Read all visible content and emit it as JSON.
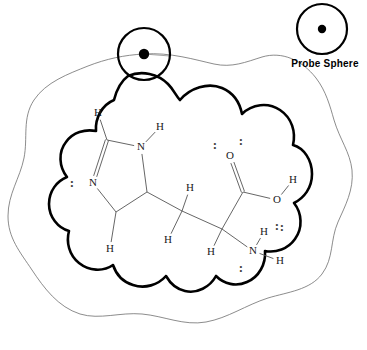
{
  "figure": {
    "legend_label": "Probe Sphere",
    "colors": {
      "molecular_surface": "#000000",
      "solvent_accessible_surface": "#6e6e6e",
      "bond": "#555555",
      "atom_text": "#1a1a1a",
      "background": "#ffffff"
    }
  },
  "probe_sphere": {
    "legend": {
      "label": "Probe Sphere",
      "cx": 322,
      "cy": 29,
      "r": 25,
      "dot_r": 4.2
    },
    "rolling": {
      "cx": 144,
      "cy": 54,
      "r": 26,
      "dot_r": 5.2
    }
  },
  "molecule": {
    "name": "histidine",
    "atoms": [
      {
        "id": "h-ring-c2",
        "label": "H",
        "x": 98,
        "y": 113
      },
      {
        "id": "c2",
        "label": "",
        "x": 107,
        "y": 140
      },
      {
        "id": "n1",
        "label": "N",
        "x": 141,
        "y": 147
      },
      {
        "id": "h-n1",
        "label": "H",
        "x": 160,
        "y": 127
      },
      {
        "id": "n3",
        "label": "N",
        "x": 93,
        "y": 183
      },
      {
        "id": "c4",
        "label": "",
        "x": 116,
        "y": 212
      },
      {
        "id": "h-c4",
        "label": "H",
        "x": 110,
        "y": 249
      },
      {
        "id": "c5",
        "label": "",
        "x": 147,
        "y": 192
      },
      {
        "id": "cb",
        "label": "",
        "x": 182,
        "y": 211
      },
      {
        "id": "h-cb-up",
        "label": "H",
        "x": 190,
        "y": 188
      },
      {
        "id": "h-cb-dn",
        "label": "H",
        "x": 168,
        "y": 240
      },
      {
        "id": "ca",
        "label": "",
        "x": 222,
        "y": 229
      },
      {
        "id": "h-ca",
        "label": "H",
        "x": 211,
        "y": 252
      },
      {
        "id": "c-carboxyl",
        "label": "",
        "x": 243,
        "y": 192
      },
      {
        "id": "o-double",
        "label": "O",
        "x": 230,
        "y": 156
      },
      {
        "id": "o-hydroxyl",
        "label": "O",
        "x": 277,
        "y": 200
      },
      {
        "id": "h-hydroxyl",
        "label": "H",
        "x": 293,
        "y": 180
      },
      {
        "id": "n-amine",
        "label": "N",
        "x": 253,
        "y": 251
      },
      {
        "id": "h-amine-up",
        "label": "H",
        "x": 264,
        "y": 232
      },
      {
        "id": "h-amine-rt",
        "label": "H",
        "x": 280,
        "y": 261
      }
    ],
    "bonds": [
      {
        "from": "h-ring-c2",
        "to": "c2",
        "order": 1
      },
      {
        "from": "c2",
        "to": "n1",
        "order": 1
      },
      {
        "from": "n1",
        "to": "h-n1",
        "order": 1
      },
      {
        "from": "c2",
        "to": "n3",
        "order": 2
      },
      {
        "from": "n3",
        "to": "c4",
        "order": 1
      },
      {
        "from": "c4",
        "to": "h-c4",
        "order": 1
      },
      {
        "from": "c4",
        "to": "c5",
        "order": 1
      },
      {
        "from": "c5",
        "to": "n1",
        "order": 1
      },
      {
        "from": "c5",
        "to": "cb",
        "order": 1
      },
      {
        "from": "cb",
        "to": "h-cb-up",
        "order": 1
      },
      {
        "from": "cb",
        "to": "h-cb-dn",
        "order": 1
      },
      {
        "from": "cb",
        "to": "ca",
        "order": 1
      },
      {
        "from": "ca",
        "to": "h-ca",
        "order": 1
      },
      {
        "from": "ca",
        "to": "c-carboxyl",
        "order": 1
      },
      {
        "from": "ca",
        "to": "n-amine",
        "order": 1
      },
      {
        "from": "c-carboxyl",
        "to": "o-double",
        "order": 2
      },
      {
        "from": "c-carboxyl",
        "to": "o-hydroxyl",
        "order": 1
      },
      {
        "from": "o-hydroxyl",
        "to": "h-hydroxyl",
        "order": 1
      },
      {
        "from": "n-amine",
        "to": "h-amine-up",
        "order": 1
      },
      {
        "from": "n-amine",
        "to": "h-amine-rt",
        "order": 1
      }
    ],
    "lone_pairs": [
      {
        "id": "lp-n3",
        "glyph": ":",
        "x": 72,
        "y": 184
      },
      {
        "id": "lp-o-left",
        "glyph": ":",
        "x": 215,
        "y": 146
      },
      {
        "id": "lp-o-top",
        "glyph": ":",
        "x": 241,
        "y": 142
      },
      {
        "id": "lp-o-hydroxyl",
        "glyph": ":",
        "x": 277,
        "y": 227
      },
      {
        "id": "lp-n-amine",
        "glyph": ":",
        "x": 241,
        "y": 269
      },
      {
        "id": "lp-n-upper",
        "glyph": ":",
        "x": 282,
        "y": 228
      }
    ]
  },
  "surfaces": {
    "molecular_surface_label": "molecular surface",
    "solvent_accessible_surface_label": "solvent accessible surface"
  }
}
